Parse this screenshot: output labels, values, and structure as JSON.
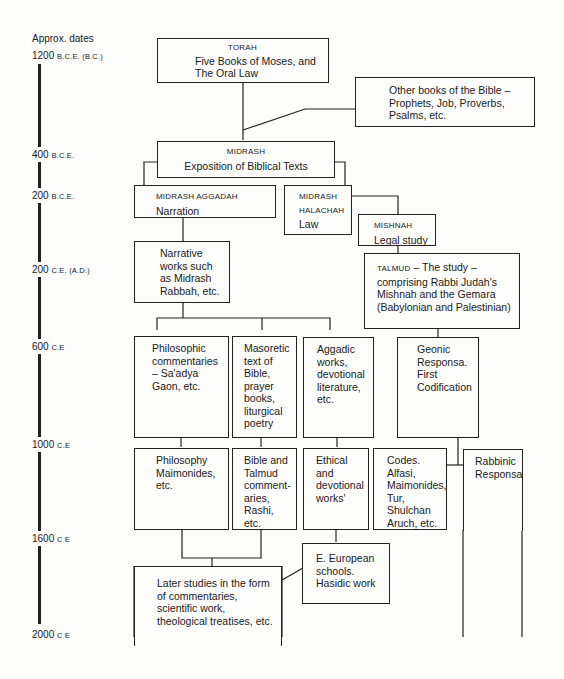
{
  "timeline": {
    "heading": "Approx. dates",
    "dates": [
      {
        "year": "1200",
        "era": "B.C.E. (B.C.)"
      },
      {
        "year": "400",
        "era": "B.C.E."
      },
      {
        "year": "200",
        "era": "B.C.E."
      },
      {
        "year": "200",
        "era": "C.E. (A.D.)"
      },
      {
        "year": "600",
        "era": "C.E"
      },
      {
        "year": "1000",
        "era": "C.E"
      },
      {
        "year": "1600",
        "era": "C E"
      },
      {
        "year": "2000",
        "era": "C E"
      }
    ]
  },
  "nodes": {
    "torah": {
      "label": "TORAH",
      "text": "Five Books of Moses, and The Oral Law"
    },
    "other_books": {
      "text": "Other books of the Bible – Prophets, Job, Proverbs, Psalms, etc."
    },
    "midrash": {
      "label": "MIDRASH",
      "text": "Exposition of Biblical Texts"
    },
    "midrash_aggadah": {
      "label": "MIDRASH AGGADAH",
      "text": "Narration"
    },
    "midrash_halachah": {
      "label1": "MIDRASH",
      "label2": "HALACHAH",
      "text": "Law"
    },
    "mishnah": {
      "label": "MISHNAH",
      "text": "Legal study"
    },
    "narrative_works": {
      "text": "Narrative works such as Midrash Rabbah, etc."
    },
    "talmud": {
      "label": "TALMUD",
      "text": " – The study – comprising Rabbi Judah's Mishnah and the Gemara (Babylonian and Palestinian)"
    },
    "philosophic_commentaries": {
      "text": "Philosophic commentaries – Sa'adya Gaon, etc."
    },
    "masoretic_text": {
      "text": "Masoretic text of Bible, prayer books, liturgical poetry"
    },
    "aggadic_works": {
      "text": "Aggadic works, devotional literature, etc."
    },
    "geonic_responsa": {
      "text": "Geonic Responsa. First Codification"
    },
    "philosophy_maimonides": {
      "text": "Philosophy Maimonides, etc."
    },
    "bible_talmud_commentaries": {
      "text": "Bible and Talmud comment-aries, Rashi, etc."
    },
    "ethical_devotional": {
      "text": "Ethical and devotional works'"
    },
    "codes": {
      "text": "Codes. Alfasi, Maimonides, Tur, Shulchan Aruch, etc."
    },
    "rabbinic_responsa": {
      "text": "Rabbinic Responsa"
    },
    "e_european_schools": {
      "text": "E. European schools. Hasidic work"
    },
    "later_studies": {
      "text": "Later studies in the form of commentaries, scientific work, theological treatises, etc."
    }
  }
}
